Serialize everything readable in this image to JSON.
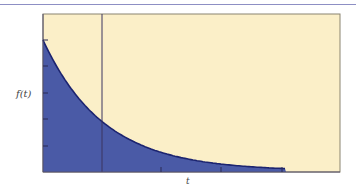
{
  "chart_data": {
    "type": "area",
    "title": "",
    "xlabel": "t",
    "ylabel": "f(t)",
    "x": [
      0,
      0.5,
      1,
      1.5,
      2,
      2.5,
      3,
      3.5,
      4
    ],
    "values": [
      1.0,
      0.61,
      0.37,
      0.22,
      0.14,
      0.08,
      0.05,
      0.03,
      0.0
    ],
    "reference_line_x": 1,
    "x_ticks": [
      "",
      "",
      ""
    ],
    "y_ticks": [
      "",
      "",
      "",
      "",
      ""
    ],
    "xlim": [
      0,
      5
    ],
    "ylim": [
      0,
      1.2
    ],
    "grid": false,
    "legend": "none",
    "colors": {
      "fill_under": "#4a5aa6",
      "background": "#fbefc8",
      "curve": "#1c2470",
      "frame": "#8a8470",
      "top_rule": "#8d8fc4"
    }
  },
  "labels": {
    "y": "f(t)",
    "x": "t"
  }
}
